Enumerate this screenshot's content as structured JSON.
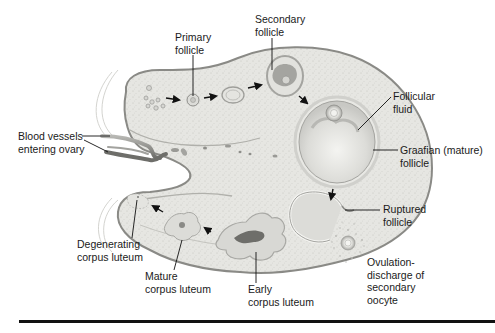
{
  "figure": {
    "colors": {
      "ovary_fill": "#e6e6e2",
      "ovary_edge": "#8a8a86",
      "follicle_fill": "#d9d9d5",
      "fluid_fill": "#efefec",
      "dark_tissue": "#8c8c88",
      "vessel": "#7e7e7a",
      "arrow": "#111111",
      "text": "#1a1a1a",
      "rule": "#111111"
    }
  },
  "labels": {
    "primary_follicle": "Primary\nfollicle",
    "secondary_follicle": "Secondary\nfollicle",
    "follicular_fluid": "Follicular\nfluid",
    "graafian_follicle": "Graafian (mature)\nfollicle",
    "ruptured_follicle": "Ruptured\nfollicle",
    "ovulation": "Ovulation-\ndischarge of\nsecondary\noocyte",
    "early_corpus_luteum": "Early\ncorpus luteum",
    "mature_corpus_luteum": "Mature\ncorpus luteum",
    "degenerating_corpus_luteum": "Degenerating\ncorpus luteum",
    "blood_vessels": "Blood vessels\nentering ovary"
  }
}
